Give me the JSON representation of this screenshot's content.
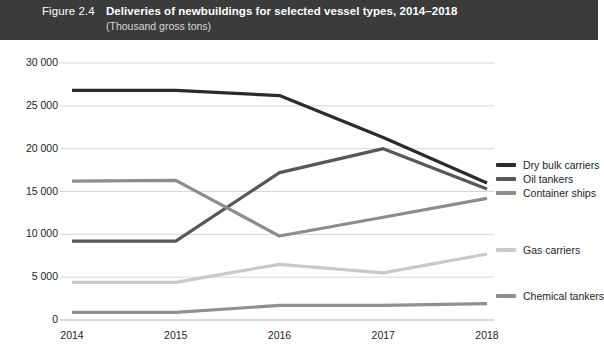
{
  "header": {
    "figure_number": "Figure 2.4",
    "title": "Deliveries of newbuildings for selected vessel types, 2014–2018",
    "subtitle": "(Thousand gross tons)",
    "band_color": "#3b3b3b",
    "text_color": "#ffffff"
  },
  "axis": {
    "y_tick_labels": [
      "30 000",
      "25 000",
      "20 000",
      "15 000",
      "10 000",
      "5 000",
      "0"
    ],
    "x_tick_labels": [
      "2014",
      "2015",
      "2016",
      "2017",
      "2018"
    ]
  },
  "legend": {
    "items": [
      {
        "label": "Dry bulk carriers",
        "color": "#2b2b2b",
        "top": 165
      },
      {
        "label": "Oil tankers",
        "color": "#585858",
        "top": 179
      },
      {
        "label": "Container ships",
        "color": "#8c8c8c",
        "top": 193
      },
      {
        "label": "Gas carriers",
        "color": "#c9c9c9",
        "top": 250
      },
      {
        "label": "Chemical tankers",
        "color": "#909090",
        "top": 296
      }
    ]
  },
  "chart_data": {
    "type": "line",
    "title": "Deliveries of newbuildings for selected vessel types, 2014–2018",
    "subtitle": "(Thousand gross tons)",
    "xlabel": "",
    "ylabel": "Thousand gross tons",
    "categories": [
      "2014",
      "2015",
      "2016",
      "2017",
      "2018"
    ],
    "ylim": [
      0,
      30000
    ],
    "ytick_step": 5000,
    "grid": "horizontal",
    "legend_position": "right",
    "series": [
      {
        "name": "Dry bulk carriers",
        "color": "#2b2b2b",
        "values": [
          26800,
          26800,
          26200,
          21300,
          16000
        ]
      },
      {
        "name": "Oil tankers",
        "color": "#585858",
        "values": [
          9200,
          9200,
          17200,
          20000,
          15300
        ]
      },
      {
        "name": "Container ships",
        "color": "#8c8c8c",
        "values": [
          16200,
          16300,
          9800,
          12000,
          14200
        ]
      },
      {
        "name": "Gas carriers",
        "color": "#c9c9c9",
        "values": [
          4400,
          4400,
          6500,
          5500,
          7700
        ]
      },
      {
        "name": "Chemical tankers",
        "color": "#909090",
        "values": [
          900,
          900,
          1700,
          1700,
          1900
        ]
      }
    ]
  }
}
